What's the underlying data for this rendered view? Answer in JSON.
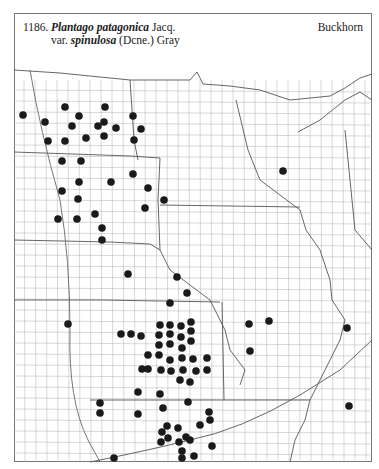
{
  "header": {
    "number": "1186.",
    "genus_species": "Plantago patagonica",
    "author": "Jacq.",
    "var_prefix": "var.",
    "variety": "spinulosa",
    "var_author": "(Dcne.) Gray",
    "common_name": "Buckhorn"
  },
  "map": {
    "region": "Great Plains / Upper Midwest county outline map",
    "dot_color": "#1a1a1a",
    "line_color": "#9a9a9a",
    "dots": [
      [
        23,
        115
      ],
      [
        45,
        122
      ],
      [
        65,
        107
      ],
      [
        79,
        116
      ],
      [
        72,
        126
      ],
      [
        48,
        141
      ],
      [
        65,
        141
      ],
      [
        86,
        138
      ],
      [
        105,
        107
      ],
      [
        104,
        122
      ],
      [
        98,
        126
      ],
      [
        116,
        128
      ],
      [
        104,
        136
      ],
      [
        133,
        116
      ],
      [
        141,
        129
      ],
      [
        134,
        140
      ],
      [
        62,
        161
      ],
      [
        81,
        161
      ],
      [
        79,
        182
      ],
      [
        62,
        191
      ],
      [
        78,
        199
      ],
      [
        58,
        219
      ],
      [
        77,
        219
      ],
      [
        95,
        214
      ],
      [
        111,
        182
      ],
      [
        133,
        174
      ],
      [
        148,
        188
      ],
      [
        164,
        200
      ],
      [
        145,
        208
      ],
      [
        102,
        228
      ],
      [
        102,
        240
      ],
      [
        283,
        171
      ],
      [
        128,
        274
      ],
      [
        177,
        277
      ],
      [
        187,
        293
      ],
      [
        170,
        303
      ],
      [
        68,
        324
      ],
      [
        160,
        325
      ],
      [
        170,
        325
      ],
      [
        181,
        326
      ],
      [
        191,
        322
      ],
      [
        121,
        334
      ],
      [
        131,
        334
      ],
      [
        141,
        336
      ],
      [
        159,
        335
      ],
      [
        170,
        334
      ],
      [
        181,
        337
      ],
      [
        191,
        331
      ],
      [
        159,
        345
      ],
      [
        170,
        344
      ],
      [
        182,
        348
      ],
      [
        191,
        341
      ],
      [
        148,
        355
      ],
      [
        159,
        355
      ],
      [
        170,
        360
      ],
      [
        182,
        358
      ],
      [
        193,
        359
      ],
      [
        207,
        358
      ],
      [
        142,
        369
      ],
      [
        148,
        369
      ],
      [
        161,
        370
      ],
      [
        171,
        371
      ],
      [
        183,
        370
      ],
      [
        196,
        371
      ],
      [
        207,
        370
      ],
      [
        180,
        380
      ],
      [
        190,
        382
      ],
      [
        249,
        324
      ],
      [
        269,
        321
      ],
      [
        250,
        351
      ],
      [
        347,
        328
      ],
      [
        349,
        406
      ],
      [
        100,
        403
      ],
      [
        100,
        413
      ],
      [
        114,
        458
      ],
      [
        138,
        392
      ],
      [
        160,
        394
      ],
      [
        163,
        408
      ],
      [
        188,
        402
      ],
      [
        138,
        414
      ],
      [
        209,
        412
      ],
      [
        210,
        420
      ],
      [
        200,
        425
      ],
      [
        162,
        432
      ],
      [
        167,
        426
      ],
      [
        178,
        428
      ],
      [
        168,
        438
      ],
      [
        186,
        437
      ],
      [
        161,
        442
      ],
      [
        179,
        442
      ],
      [
        190,
        440
      ],
      [
        212,
        446
      ],
      [
        182,
        451
      ],
      [
        182,
        458
      ],
      [
        194,
        456
      ]
    ]
  }
}
